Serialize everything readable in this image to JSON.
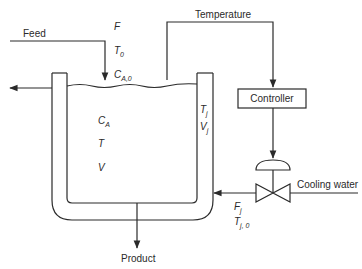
{
  "diagram": {
    "type": "jacketed CSTR with temperature control",
    "colors": {
      "line": "#2a2a2a",
      "background": "#ffffff"
    },
    "labels": {
      "feed": "Feed",
      "temperature": "Temperature",
      "controller": "Controller",
      "cooling_water": "Cooling water",
      "product": "Product"
    },
    "feed_vars": {
      "F": "F",
      "T0_main": "T",
      "T0_sub": "0",
      "CA0_main": "C",
      "CA0_sub": "A,0"
    },
    "reactor_vars": {
      "CA_main": "C",
      "CA_sub": "A",
      "T": "T",
      "V": "V"
    },
    "jacket_vars": {
      "Tj_main": "T",
      "Tj_sub": "j",
      "Vj_main": "V",
      "Vj_sub": "j"
    },
    "coolant_vars": {
      "Fj_main": "F",
      "Fj_sub": "j",
      "Tj0_main": "T",
      "Tj0_sub": "j, 0"
    },
    "icons": {
      "valve": "control-valve-icon",
      "actuator": "diaphragm-actuator-icon",
      "arrow": "flow-arrow-icon"
    }
  }
}
